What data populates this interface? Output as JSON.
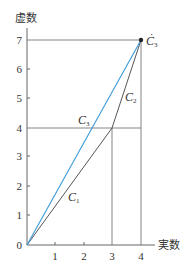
{
  "diagram": {
    "type": "complex-plane-vector-diagram",
    "axes": {
      "x_label": "実数",
      "y_label": "虚数",
      "x_ticks": [
        "0",
        "1",
        "2",
        "3",
        "4"
      ],
      "y_ticks": [
        "1",
        "2",
        "3",
        "4",
        "5",
        "6",
        "7"
      ]
    },
    "labels": {
      "c1": {
        "main": "C",
        "sub": "1"
      },
      "c2": {
        "main": "C",
        "sub": "2"
      },
      "c3": {
        "main": "C",
        "sub": "3"
      },
      "c3_point": {
        "main": "Ċ",
        "sub": "3"
      }
    },
    "points": {
      "origin": [
        0,
        0
      ],
      "c1_end": [
        3,
        4
      ],
      "c3_end": [
        4,
        7
      ]
    },
    "colors": {
      "line": "#555555",
      "c3_line": "#3a9ad9",
      "guide": "#666666"
    }
  }
}
